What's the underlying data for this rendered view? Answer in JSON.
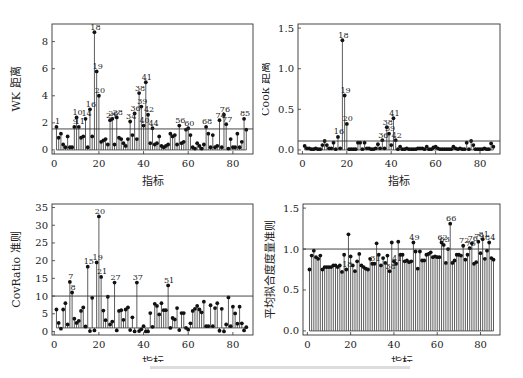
{
  "chart_data": [
    {
      "type": "stem",
      "id": "wk",
      "title": "",
      "xlabel": "指标",
      "ylabel": "WK 距离",
      "xlim": [
        -1,
        89
      ],
      "ylim": [
        -0.3,
        9.3
      ],
      "xticks": [
        0,
        20,
        40,
        60,
        80
      ],
      "yticks": [
        0,
        2,
        4,
        6,
        8
      ],
      "threshold": 1.55,
      "x": [
        1,
        2,
        3,
        4,
        5,
        6,
        7,
        8,
        9,
        10,
        11,
        12,
        13,
        14,
        15,
        16,
        17,
        18,
        19,
        20,
        21,
        22,
        23,
        24,
        25,
        26,
        27,
        28,
        29,
        30,
        31,
        32,
        33,
        34,
        35,
        36,
        37,
        38,
        39,
        40,
        41,
        42,
        43,
        44,
        45,
        46,
        47,
        48,
        49,
        50,
        51,
        52,
        53,
        54,
        55,
        56,
        57,
        58,
        59,
        60,
        61,
        62,
        63,
        64,
        65,
        66,
        67,
        68,
        69,
        70,
        71,
        72,
        73,
        74,
        75,
        76,
        77,
        78,
        79,
        80,
        81,
        82,
        83,
        84,
        85,
        86
      ],
      "values": [
        1.7,
        0.9,
        1.2,
        0.4,
        0.2,
        1.0,
        0.2,
        0.2,
        1.7,
        2.4,
        1.7,
        0.9,
        1.0,
        2.3,
        0.2,
        3.0,
        1.0,
        8.7,
        5.8,
        4.0,
        0.6,
        0.7,
        0.8,
        0.4,
        2.2,
        2.3,
        0.4,
        2.4,
        0.9,
        0.8,
        0.5,
        0.3,
        0.8,
        2.1,
        1.1,
        2.7,
        0.8,
        4.2,
        3.2,
        1.8,
        5.0,
        2.6,
        0.5,
        1.6,
        0.4,
        0.5,
        1.0,
        0.3,
        0.2,
        0.3,
        0.4,
        1.2,
        1.0,
        1.1,
        0.4,
        1.8,
        0.5,
        0.6,
        1.5,
        1.6,
        1.1,
        0.2,
        0.1,
        0.5,
        0.3,
        0.1,
        0.4,
        1.7,
        1.2,
        0.2,
        1.1,
        0.2,
        0.3,
        2.2,
        0.2,
        2.6,
        1.9,
        0.1,
        0.8,
        0.2,
        0.2,
        1.2,
        0.2,
        0.6,
        2.3,
        1.5
      ],
      "labels": [
        {
          "x": 1,
          "text": "1"
        },
        {
          "x": 9,
          "text": "9"
        },
        {
          "x": 10,
          "text": "10"
        },
        {
          "x": 11,
          "text": "11"
        },
        {
          "x": 14,
          "text": "14"
        },
        {
          "x": 16,
          "text": "16"
        },
        {
          "x": 18,
          "text": "18"
        },
        {
          "x": 19,
          "text": "19"
        },
        {
          "x": 20,
          "text": "20"
        },
        {
          "x": 25,
          "text": "25"
        },
        {
          "x": 26,
          "text": "26"
        },
        {
          "x": 28,
          "text": "28"
        },
        {
          "x": 34,
          "text": "34"
        },
        {
          "x": 36,
          "text": "36"
        },
        {
          "x": 38,
          "text": "38"
        },
        {
          "x": 39,
          "text": "39"
        },
        {
          "x": 40,
          "text": "40"
        },
        {
          "x": 41,
          "text": "41"
        },
        {
          "x": 42,
          "text": "42"
        },
        {
          "x": 44,
          "text": "44"
        },
        {
          "x": 56,
          "text": "56"
        },
        {
          "x": 60,
          "text": "60"
        },
        {
          "x": 68,
          "text": "68"
        },
        {
          "x": 74,
          "text": "74"
        },
        {
          "x": 76,
          "text": "76"
        },
        {
          "x": 77,
          "text": "77"
        },
        {
          "x": 85,
          "text": "85"
        }
      ]
    },
    {
      "type": "stem",
      "id": "cook",
      "title": "",
      "xlabel": "指标",
      "ylabel": "Cook 距离",
      "xlim": [
        -2,
        89
      ],
      "ylim": [
        -0.05,
        1.55
      ],
      "xticks": [
        0,
        20,
        40,
        60,
        80
      ],
      "yticks": [
        0.0,
        0.5,
        1.0,
        1.5
      ],
      "ytick_labels": [
        "0.0",
        "0.5",
        "1.0",
        "1.5"
      ],
      "threshold": 0.11,
      "x": [
        1,
        2,
        3,
        4,
        5,
        6,
        7,
        8,
        9,
        10,
        11,
        12,
        13,
        14,
        15,
        16,
        17,
        18,
        19,
        20,
        21,
        22,
        23,
        24,
        25,
        26,
        27,
        28,
        29,
        30,
        31,
        32,
        33,
        34,
        35,
        36,
        37,
        38,
        39,
        40,
        41,
        42,
        43,
        44,
        45,
        46,
        47,
        48,
        49,
        50,
        51,
        52,
        53,
        54,
        55,
        56,
        57,
        58,
        59,
        60,
        61,
        62,
        63,
        64,
        65,
        66,
        67,
        68,
        69,
        70,
        71,
        72,
        73,
        74,
        75,
        76,
        77,
        78,
        79,
        80,
        81,
        82,
        83,
        84,
        85,
        86
      ],
      "values": [
        0.05,
        0.02,
        0.02,
        0.01,
        0.01,
        0.02,
        0.01,
        0.01,
        0.06,
        0.11,
        0.06,
        0.02,
        0.02,
        0.09,
        0.01,
        0.16,
        0.02,
        1.35,
        0.67,
        0.32,
        0.01,
        0.01,
        0.01,
        0.01,
        0.09,
        0.09,
        0.01,
        0.09,
        0.02,
        0.02,
        0.01,
        0.01,
        0.02,
        0.07,
        0.02,
        0.12,
        0.02,
        0.28,
        0.2,
        0.06,
        0.39,
        0.12,
        0.01,
        0.04,
        0.01,
        0.01,
        0.02,
        0.01,
        0.01,
        0.01,
        0.01,
        0.02,
        0.02,
        0.02,
        0.01,
        0.04,
        0.01,
        0.01,
        0.03,
        0.04,
        0.02,
        0.01,
        0.01,
        0.01,
        0.01,
        0.01,
        0.01,
        0.04,
        0.02,
        0.01,
        0.02,
        0.01,
        0.01,
        0.09,
        0.01,
        0.11,
        0.06,
        0.01,
        0.01,
        0.01,
        0.01,
        0.02,
        0.01,
        0.01,
        0.08,
        0.04
      ],
      "labels": [
        {
          "x": 16,
          "text": "16"
        },
        {
          "x": 18,
          "text": "18"
        },
        {
          "x": 19,
          "text": "19"
        },
        {
          "x": 20,
          "text": "20"
        },
        {
          "x": 36,
          "text": "36"
        },
        {
          "x": 38,
          "text": "38"
        },
        {
          "x": 39,
          "text": "39"
        },
        {
          "x": 41,
          "text": "41"
        },
        {
          "x": 42,
          "text": "42"
        }
      ]
    },
    {
      "type": "stem",
      "id": "covratio",
      "title": "",
      "xlabel": "指标",
      "ylabel": "CovRatio 准则",
      "xlim": [
        -1,
        89
      ],
      "ylim": [
        -1,
        36
      ],
      "xticks": [
        0,
        20,
        40,
        60,
        80
      ],
      "yticks": [
        0,
        5,
        10,
        15,
        20,
        25,
        30,
        35
      ],
      "threshold": 10,
      "baseline": 1,
      "x": [
        1,
        2,
        3,
        4,
        5,
        6,
        7,
        8,
        9,
        10,
        11,
        12,
        13,
        14,
        15,
        16,
        17,
        18,
        19,
        20,
        21,
        22,
        23,
        24,
        25,
        26,
        27,
        28,
        29,
        30,
        31,
        32,
        33,
        34,
        35,
        36,
        37,
        38,
        39,
        40,
        41,
        42,
        43,
        44,
        45,
        46,
        47,
        48,
        49,
        50,
        51,
        52,
        53,
        54,
        55,
        56,
        57,
        58,
        59,
        60,
        61,
        62,
        63,
        64,
        65,
        66,
        67,
        68,
        69,
        70,
        71,
        72,
        73,
        74,
        75,
        76,
        77,
        78,
        79,
        80,
        81,
        82,
        83,
        84,
        85,
        86
      ],
      "values": [
        6.2,
        2.4,
        0.8,
        6.2,
        8.0,
        2.0,
        14.0,
        11.0,
        3.6,
        2.4,
        3.0,
        5.8,
        6.8,
        1.4,
        18.3,
        0.1,
        9.5,
        0.3,
        19.5,
        32.5,
        15.4,
        5.9,
        3.2,
        9.8,
        2.0,
        2.8,
        13.8,
        0.3,
        5.8,
        6.0,
        3.3,
        6.2,
        6.8,
        0.4,
        4.0,
        0.0,
        13.8,
        0.1,
        0.6,
        1.5,
        0.0,
        0.0,
        5.2,
        1.3,
        7.8,
        7.2,
        4.8,
        8.0,
        6.0,
        6.0,
        13.0,
        1.0,
        3.8,
        3.4,
        6.6,
        0.4,
        5.2,
        5.2,
        1.0,
        0.5,
        2.3,
        5.8,
        6.4,
        7.2,
        6.2,
        5.4,
        8.4,
        1.5,
        1.5,
        7.4,
        1.5,
        6.6,
        8.0,
        0.2,
        6.4,
        0.0,
        2.0,
        9.6,
        1.5,
        7.0,
        5.1,
        2.2,
        7.0,
        2.3,
        0.3,
        1.2
      ],
      "labels": [
        {
          "x": 7,
          "text": "7"
        },
        {
          "x": 8,
          "text": "8"
        },
        {
          "x": 15,
          "text": "15"
        },
        {
          "x": 19,
          "text": "19"
        },
        {
          "x": 20,
          "text": "20"
        },
        {
          "x": 21,
          "text": "21"
        },
        {
          "x": 27,
          "text": "27"
        },
        {
          "x": 37,
          "text": "37"
        },
        {
          "x": 51,
          "text": "51"
        }
      ]
    },
    {
      "type": "stem",
      "id": "avgfit",
      "title": "",
      "xlabel": "指标",
      "ylabel": "平均拟合度度量准则",
      "xlim": [
        -2,
        89
      ],
      "ylim": [
        -0.05,
        1.55
      ],
      "xticks": [
        0,
        20,
        40,
        60,
        80
      ],
      "yticks": [
        0.0,
        0.5,
        1.0,
        1.5
      ],
      "ytick_labels": [
        "0.0",
        "0.5",
        "1.0",
        "1.5"
      ],
      "threshold": 1.0,
      "x": [
        1,
        2,
        3,
        4,
        5,
        6,
        7,
        8,
        9,
        10,
        11,
        12,
        13,
        14,
        15,
        16,
        17,
        18,
        19,
        20,
        21,
        22,
        23,
        24,
        25,
        26,
        27,
        28,
        29,
        30,
        31,
        32,
        33,
        34,
        35,
        36,
        37,
        38,
        39,
        40,
        41,
        42,
        43,
        44,
        45,
        46,
        47,
        48,
        49,
        50,
        51,
        52,
        53,
        54,
        55,
        56,
        57,
        58,
        59,
        60,
        61,
        62,
        63,
        64,
        65,
        66,
        67,
        68,
        69,
        70,
        71,
        72,
        73,
        74,
        75,
        76,
        77,
        78,
        79,
        80,
        81,
        82,
        83,
        84,
        85,
        86
      ],
      "values": [
        0.75,
        0.92,
        0.98,
        0.9,
        0.88,
        0.92,
        0.75,
        0.78,
        0.78,
        0.78,
        0.78,
        0.8,
        0.8,
        0.78,
        0.8,
        0.72,
        0.93,
        0.75,
        1.18,
        0.91,
        0.8,
        0.73,
        0.85,
        0.94,
        0.8,
        0.78,
        0.76,
        0.75,
        0.88,
        0.82,
        0.82,
        1.07,
        0.93,
        0.8,
        0.89,
        0.83,
        0.92,
        0.73,
        1.08,
        0.85,
        0.82,
        1.09,
        0.93,
        0.93,
        0.85,
        0.86,
        0.84,
        0.85,
        1.08,
        0.97,
        0.76,
        0.97,
        0.86,
        0.86,
        0.93,
        0.94,
        0.96,
        0.9,
        0.91,
        0.9,
        0.9,
        1.08,
        1.05,
        0.83,
        1.0,
        1.31,
        0.83,
        0.86,
        0.93,
        0.93,
        0.92,
        1.04,
        0.87,
        0.93,
        1.01,
        1.07,
        0.82,
        0.84,
        1.09,
        0.95,
        1.12,
        0.88,
        0.98,
        1.08,
        0.89,
        0.87
      ],
      "labels": [
        {
          "x": 18,
          "text": "18"
        },
        {
          "x": 31,
          "text": "31"
        },
        {
          "x": 38,
          "text": "38"
        },
        {
          "x": 41,
          "text": "41"
        },
        {
          "x": 49,
          "text": "49"
        },
        {
          "x": 62,
          "text": "62"
        },
        {
          "x": 63,
          "text": "63"
        },
        {
          "x": 66,
          "text": "66"
        },
        {
          "x": 72,
          "text": "72"
        },
        {
          "x": 75,
          "text": "75"
        },
        {
          "x": 76,
          "text": "76"
        },
        {
          "x": 79,
          "text": "79"
        },
        {
          "x": 81,
          "text": "81"
        },
        {
          "x": 84,
          "text": "84"
        }
      ]
    }
  ],
  "panels": [
    {
      "xlabel": "指标",
      "ylabel": "WK 距离"
    },
    {
      "xlabel": "指标",
      "ylabel": "Cook 距离"
    },
    {
      "xlabel": "指标",
      "ylabel": "CovRatio 准则"
    },
    {
      "xlabel": "指标",
      "ylabel": "平均拟合度度量准则"
    }
  ]
}
